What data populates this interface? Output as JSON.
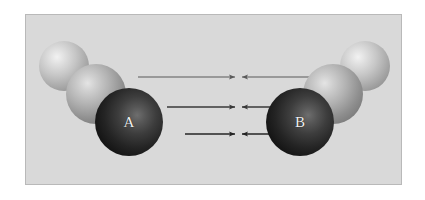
{
  "figure": {
    "panel": {
      "background_color": "#d9d9d9",
      "border_color": "#b9b9b9"
    },
    "clusters": [
      {
        "name": "cluster-a",
        "label": "A",
        "side": "left",
        "spheres": [
          {
            "name": "sphere-a-rear",
            "tone": "light",
            "cx": 38,
            "cy": 51,
            "r": 25
          },
          {
            "name": "sphere-a-middle",
            "tone": "mid",
            "cx": 70,
            "cy": 79,
            "r": 30
          },
          {
            "name": "sphere-a-core",
            "tone": "dark",
            "cx": 103,
            "cy": 107,
            "r": 34
          }
        ]
      },
      {
        "name": "cluster-b",
        "label": "B",
        "side": "right",
        "spheres": [
          {
            "name": "sphere-b-rear",
            "tone": "light",
            "cx": 339,
            "cy": 51,
            "r": 25
          },
          {
            "name": "sphere-b-middle",
            "tone": "mid",
            "cx": 307,
            "cy": 79,
            "r": 30
          },
          {
            "name": "sphere-b-core",
            "tone": "dark",
            "cx": 274,
            "cy": 107,
            "r": 34
          }
        ]
      }
    ],
    "arrows": {
      "color": "#3a3a3a",
      "meeting_point_x": 212,
      "pairs": [
        {
          "name": "arrow-pair-top",
          "y": 62,
          "left_start_x": 112,
          "left_end_x": 209,
          "right_start_x": 313,
          "right_end_x": 216,
          "stroke_width": 1.1,
          "color": "#5a5a5a"
        },
        {
          "name": "arrow-pair-middle",
          "y": 92,
          "left_start_x": 141,
          "left_end_x": 209,
          "right_start_x": 284,
          "right_end_x": 216,
          "stroke_width": 1.3,
          "color": "#383838"
        },
        {
          "name": "arrow-pair-bottom",
          "y": 119,
          "left_start_x": 159,
          "left_end_x": 209,
          "right_start_x": 266,
          "right_end_x": 216,
          "stroke_width": 1.5,
          "color": "#242424"
        }
      ]
    }
  }
}
